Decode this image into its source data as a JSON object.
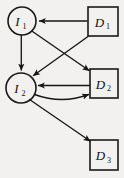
{
  "figure": {
    "type": "influence-diagram",
    "background_color": "#f2f1ef",
    "stroke_color": "#1a1a1a",
    "width": 124,
    "height": 178
  },
  "nodes": [
    {
      "id": "I1",
      "shape": "circle",
      "label_main": "I",
      "label_sub": "1",
      "cx": 22,
      "cy": 21,
      "r": 14
    },
    {
      "id": "I2",
      "shape": "circle",
      "label_main": "I",
      "label_sub": "2",
      "cx": 21,
      "cy": 88,
      "r": 15
    },
    {
      "id": "D1",
      "shape": "rect",
      "label_main": "D",
      "label_sub": "1",
      "x": 88,
      "y": 7,
      "w": 30,
      "h": 29
    },
    {
      "id": "D2",
      "shape": "rect",
      "label_main": "D",
      "label_sub": "2",
      "x": 90,
      "y": 69,
      "w": 28,
      "h": 29
    },
    {
      "id": "D3",
      "shape": "rect",
      "label_main": "D",
      "label_sub": "3",
      "x": 90,
      "y": 140,
      "w": 28,
      "h": 30
    }
  ],
  "edges": [
    {
      "id": "e-d1-i1",
      "from": "D1",
      "to": "I1",
      "style": "straight",
      "arrow": "end"
    },
    {
      "id": "e-d1-i2",
      "from": "D1",
      "to": "I2",
      "style": "straight",
      "arrow": "end"
    },
    {
      "id": "e-i1-i2",
      "from": "I1",
      "to": "I2",
      "style": "straight",
      "arrow": "end"
    },
    {
      "id": "e-i1-d2",
      "from": "I1",
      "to": "D2",
      "style": "straight",
      "arrow": "end"
    },
    {
      "id": "e-d2-i2",
      "from": "D2",
      "to": "I2",
      "style": "straight",
      "arrow": "end"
    },
    {
      "id": "e-i2-d2",
      "from": "I2",
      "to": "D2",
      "style": "curved",
      "arrow": "end"
    },
    {
      "id": "e-i2-d3",
      "from": "I2",
      "to": "D3",
      "style": "straight",
      "arrow": "end"
    }
  ]
}
